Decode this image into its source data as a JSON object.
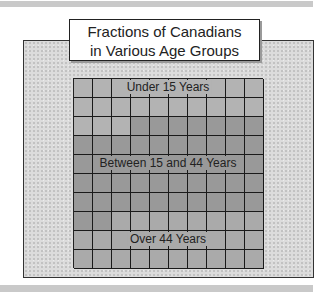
{
  "title": {
    "line1": "Fractions of Canadians",
    "line2": "in Various Age Groups"
  },
  "groups": [
    {
      "label": "Under 15 Years",
      "cells": 23,
      "color": "#b3b3b3"
    },
    {
      "label": "Between 15 and 44 Years",
      "cells": 49,
      "color": "#999999"
    },
    {
      "label": "Over 44 Years",
      "cells": 28,
      "color": "#aaaaaa"
    }
  ],
  "grid": {
    "rows": 10,
    "cols": 10
  },
  "chart_data": {
    "type": "waffle",
    "title": "Fractions of Canadians in Various Age Groups",
    "categories": [
      "Under 15 Years",
      "Between 15 and 44 Years",
      "Over 44 Years"
    ],
    "values": [
      23,
      49,
      28
    ],
    "total": 100,
    "unit": "cells out of 100 (percent)"
  }
}
